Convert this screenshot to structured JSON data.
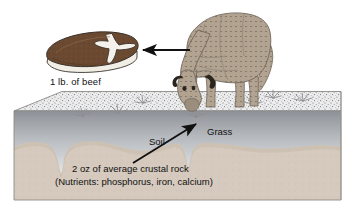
{
  "figure": {
    "title_alt": "Nutrient transfer from crustal rock through soil and grass to beef",
    "labels": {
      "beef": "1 lb. of beef",
      "soil": "Soil",
      "grass": "Grass",
      "rock_line1": "2 oz of average crustal rock",
      "rock_line2": "(Nutrients: phosphorus, iron, calcium)"
    },
    "elements": {
      "cow": "cow-grazing",
      "steak": "beef-steak",
      "ground_block": "soil-block",
      "arrow_cow_to_beef": "arrow-left",
      "arrow_rock_to_grass": "arrow-up-right",
      "grass_tufts": 7
    },
    "colors": {
      "background": "#ffffff",
      "cow_body": "#b3a493",
      "cow_outline": "#6b6258",
      "steak_meat": "#6b4a32",
      "steak_bone": "#f2efe7",
      "steak_fat": "#efece4",
      "steak_outline": "#3a332c",
      "soil_top_speckle": "#e9e9ea",
      "soil_gradient_top": "#9a9ea3",
      "soil_gradient_bottom": "#f0f1f2",
      "bedrock": "#d4c9bc",
      "bedrock_shadow": "#c6b9aa",
      "block_edge": "#9a958d",
      "arrow": "#111111",
      "grass": "#8b8b8e",
      "text": "#111111"
    },
    "layers": [
      {
        "name": "grass-surface",
        "description": "speckled top surface of block"
      },
      {
        "name": "soil",
        "description": "gray gradient layer"
      },
      {
        "name": "crustal-rock",
        "description": "tan bedrock with notches"
      }
    ]
  }
}
